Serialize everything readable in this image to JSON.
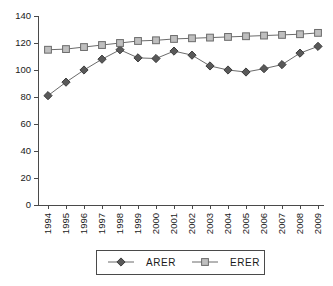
{
  "chart_data": {
    "type": "line",
    "title": "",
    "subtitle": "",
    "xlabel": "",
    "ylabel": "",
    "categories": [
      "1994",
      "1995",
      "1996",
      "1997",
      "1998",
      "1999",
      "2000",
      "2001",
      "2002",
      "2003",
      "2004",
      "2005",
      "2006",
      "2007",
      "2008",
      "2009"
    ],
    "series": [
      {
        "name": "ARER",
        "marker": "diamond",
        "color": "#595959",
        "values": [
          81,
          91,
          100,
          108,
          115,
          109,
          108.5,
          114,
          111,
          103,
          100,
          98.5,
          101,
          104,
          112.5,
          117.5
        ]
      },
      {
        "name": "ERER",
        "marker": "square",
        "color": "#bfbfbf",
        "values": [
          115,
          115.5,
          117,
          118.5,
          120,
          121.5,
          122,
          123,
          123.5,
          124,
          124.5,
          125,
          125.5,
          126,
          126.5,
          127.5
        ]
      }
    ],
    "ylim": [
      0,
      140
    ],
    "yticks": [
      0,
      20,
      40,
      60,
      80,
      100,
      120,
      140
    ],
    "ytick_labels": [
      "0",
      "20",
      "40",
      "60",
      "80",
      "100",
      "120",
      "140"
    ],
    "grid": false,
    "legend_position": "bottom",
    "line_color": "#6b6b6b",
    "axis_color": "#4a4a4a"
  },
  "legend": {
    "entries": [
      {
        "label": "ARER",
        "marker": "diamond-marker"
      },
      {
        "label": "ERER",
        "marker": "square-marker"
      }
    ]
  },
  "caption": {
    "text": ""
  }
}
